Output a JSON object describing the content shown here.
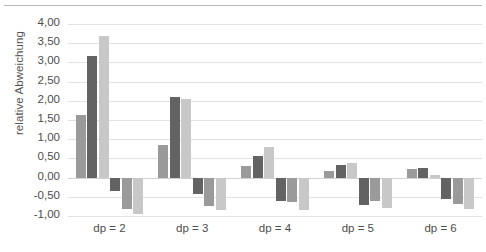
{
  "chart": {
    "type": "bar",
    "title": "",
    "ylabel": "relative Abweichung",
    "xlabel": ""
  },
  "axis": {
    "yticks": [
      "4,00",
      "3,50",
      "3,00",
      "2,50",
      "2,00",
      "1,50",
      "1,00",
      "0,50",
      "0,00",
      "-0,50",
      "-1,00"
    ],
    "ymin": -1.0,
    "ymax": 4.0,
    "ystep": 0.5,
    "xticks": [
      "dp = 2",
      "dp = 3",
      "dp = 4",
      "dp = 5",
      "dp = 6"
    ]
  },
  "colors": {
    "series_a": "#9a9a9a",
    "series_b": "#636363",
    "series_c": "#c8c8c8",
    "gridline": "#e2e2e2",
    "text": "#4d4d4d"
  },
  "chart_data": {
    "type": "bar",
    "title": "",
    "xlabel": "",
    "ylabel": "relative Abweichung",
    "categories": [
      "dp = 2",
      "dp = 3",
      "dp = 4",
      "dp = 5",
      "dp = 6"
    ],
    "ylim": [
      -1.0,
      4.0
    ],
    "ystep": 0.5,
    "grid": true,
    "legend": "none",
    "ytick_labels": [
      "4,00",
      "3,50",
      "3,00",
      "2,50",
      "2,00",
      "1,50",
      "1,00",
      "0,50",
      "0,00",
      "-0,50",
      "-1,00"
    ],
    "series": [
      {
        "name": "pos-1",
        "color": "#9a9a9a",
        "values": [
          1.64,
          0.86,
          0.3,
          0.16,
          0.22
        ]
      },
      {
        "name": "pos-2",
        "color": "#636363",
        "values": [
          3.17,
          2.1,
          0.56,
          0.33,
          0.26
        ]
      },
      {
        "name": "pos-3",
        "color": "#c8c8c8",
        "values": [
          3.7,
          2.05,
          0.8,
          0.37,
          0.06
        ]
      },
      {
        "name": "neg-1",
        "color": "#636363",
        "values": [
          -0.36,
          -0.42,
          -0.6,
          -0.72,
          -0.57
        ]
      },
      {
        "name": "neg-2",
        "color": "#9a9a9a",
        "values": [
          -0.82,
          -0.73,
          -0.63,
          -0.62,
          -0.7
        ]
      },
      {
        "name": "neg-3",
        "color": "#c8c8c8",
        "values": [
          -0.95,
          -0.85,
          -0.84,
          -0.78,
          -0.82
        ]
      }
    ]
  }
}
